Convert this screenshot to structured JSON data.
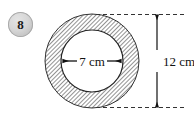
{
  "figure": {
    "question_number": "8",
    "shape_name": "annulus",
    "fill_pattern": "diagonal-hatch",
    "inner_fill": "#ffffff",
    "hatch_color": "#6f6f6f",
    "outline_color": "#222222",
    "badge_color": "#d6d6d6",
    "dimensions": [
      {
        "id": "inner-diameter",
        "label": "7 cm",
        "value": 7,
        "unit": "cm",
        "orientation": "horizontal",
        "measures": "inner circle diameter"
      },
      {
        "id": "outer-diameter",
        "label": "12 cm",
        "value": 12,
        "unit": "cm",
        "orientation": "vertical",
        "measures": "outer circle diameter"
      }
    ],
    "geometry": {
      "center_x": 92,
      "center_y": 61,
      "outer_radius": 47,
      "inner_radius": 31,
      "dimension_line_x": 157,
      "extension_top_y": 15,
      "extension_bottom_y": 108
    }
  }
}
